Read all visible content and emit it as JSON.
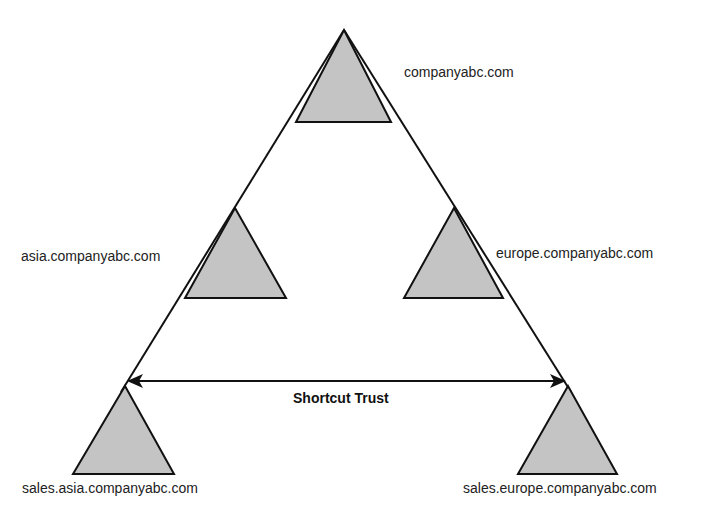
{
  "diagram": {
    "type": "domain-tree-trust",
    "colors": {
      "domain_fill": "#c4c4c4",
      "stroke": "#111111",
      "background": "#ffffff"
    },
    "domains": [
      {
        "id": "root",
        "label": "companyabc.com"
      },
      {
        "id": "asia",
        "label": "asia.companyabc.com"
      },
      {
        "id": "europe",
        "label": "europe.companyabc.com"
      },
      {
        "id": "sales-asia",
        "label": "sales.asia.companyabc.com"
      },
      {
        "id": "sales-europe",
        "label": "sales.europe.companyabc.com"
      }
    ],
    "shortcut_trust": {
      "label": "Shortcut Trust",
      "from": "sales-asia",
      "to": "sales-europe",
      "bidirectional": true
    }
  }
}
